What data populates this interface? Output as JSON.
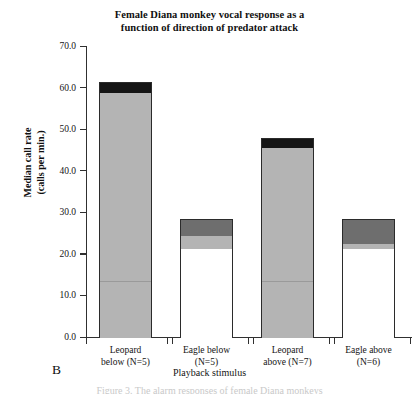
{
  "title": {
    "line1": "Female Diana monkey vocal response as a",
    "line2": "function of direction of predator attack"
  },
  "panel_label": "B",
  "caption_fragment": "Figure 3. The alarm responses of female Diana monkeys",
  "axes": {
    "y_title_line1": "Median call rate",
    "y_title_line2": "(calls per min.)",
    "x_title": "Playback stimulus",
    "y_ticks": [
      "70.0",
      "60.0",
      "50.0",
      "40.0",
      "30.0",
      "20.0",
      "10.0",
      "0.0"
    ]
  },
  "chart_data": {
    "type": "bar",
    "title": "Female Diana monkey vocal response as a function of direction of predator attack",
    "xlabel": "Playback stimulus",
    "ylabel": "Median call rate (calls per min.)",
    "ylim": [
      0.0,
      70.0
    ],
    "ytick_step": 10.0,
    "grid": false,
    "legend": "none",
    "stacked": true,
    "categories": [
      "Leopard below (N=5)",
      "Eagle below (N=5)",
      "Leopard above (N=7)",
      "Eagle above (N=6)"
    ],
    "totals": [
      61.3,
      28.4,
      47.9,
      28.4
    ],
    "series": [
      {
        "name": "lower segment (white)",
        "color": "#ffffff",
        "values": [
          13.7,
          21.4,
          0.0,
          21.4
        ]
      },
      {
        "name": "middle segment (light gray)",
        "color": "#b4b4b4",
        "values": [
          45.2,
          3.1,
          45.7,
          1.2
        ]
      },
      {
        "name": "upper segment (dark gray)",
        "color": "#6e6e6e",
        "values": [
          0.0,
          3.9,
          0.0,
          5.8
        ]
      },
      {
        "name": "top segment (black)",
        "color": "#151515",
        "values": [
          2.4,
          0.0,
          2.2,
          0.0
        ]
      }
    ],
    "bars": [
      {
        "category": "Leopard below (N=5)",
        "label_line1": "Leopard",
        "label_line2": "below (N=5)",
        "n": 5,
        "total": 61.3,
        "segments": [
          {
            "fill": "black",
            "from": 58.9,
            "to": 61.3
          },
          {
            "fill": "light",
            "from": 13.7,
            "to": 58.9
          },
          {
            "fill": "light",
            "from": 0.0,
            "to": 13.7
          }
        ]
      },
      {
        "category": "Eagle below (N=5)",
        "label_line1": "Eagle below",
        "label_line2": "(N=5)",
        "n": 5,
        "total": 28.4,
        "segments": [
          {
            "fill": "dark",
            "from": 24.5,
            "to": 28.4
          },
          {
            "fill": "light",
            "from": 21.4,
            "to": 24.5
          },
          {
            "fill": "white",
            "from": 0.0,
            "to": 21.4
          }
        ]
      },
      {
        "category": "Leopard above (N=7)",
        "label_line1": "Leopard",
        "label_line2": "above (N=7)",
        "n": 7,
        "total": 47.9,
        "segments": [
          {
            "fill": "black",
            "from": 45.7,
            "to": 47.9
          },
          {
            "fill": "light",
            "from": 13.7,
            "to": 45.7
          },
          {
            "fill": "light",
            "from": 0.0,
            "to": 13.7
          }
        ]
      },
      {
        "category": "Eagle above (N=6)",
        "label_line1": "Eagle above",
        "label_line2": "(N=6)",
        "n": 6,
        "total": 28.4,
        "segments": [
          {
            "fill": "dark",
            "from": 22.6,
            "to": 28.4
          },
          {
            "fill": "light",
            "from": 21.4,
            "to": 22.6
          },
          {
            "fill": "white",
            "from": 0.0,
            "to": 21.4
          }
        ]
      }
    ]
  }
}
